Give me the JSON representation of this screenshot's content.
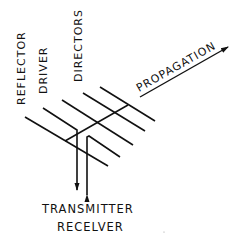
{
  "diagram": {
    "labels": {
      "reflector": "REFLECTOR",
      "driver": "DRIVER",
      "directors": "DIRECTORS",
      "propagation": "PROPAGATION",
      "transmitter": "TRANSMITTER",
      "receiver": "RECELVER"
    },
    "colors": {
      "ink": "#111111",
      "background": "#ffffff"
    }
  }
}
